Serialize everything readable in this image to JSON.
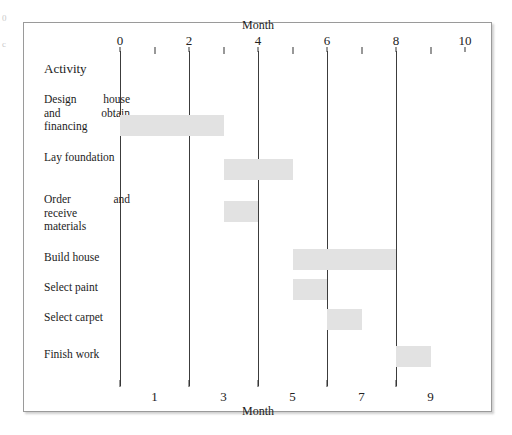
{
  "figure": {
    "axis_title_top": "Month",
    "axis_title_bottom": "Month",
    "activity_header": "Activity",
    "bar_color": "#e2e2e2",
    "gridline_color": "#3c3c3c",
    "frame_border_color": "#9a9a9a"
  },
  "margin_artifacts": [
    "0",
    "c"
  ],
  "chart_data": {
    "type": "bar",
    "subtype": "gantt",
    "title": "",
    "xlabel": "Month",
    "ylabel": "Activity",
    "xlim": [
      0,
      10
    ],
    "grid": true,
    "legend": "none",
    "top_axis": {
      "major_ticks": [
        0,
        2,
        4,
        6,
        8,
        10
      ],
      "major_tick_labels": [
        "0",
        "2",
        "4",
        "6",
        "8",
        "10"
      ],
      "minor_ticks": [
        1,
        3,
        5,
        7,
        9
      ],
      "gridline_values": [
        0,
        2,
        4,
        6,
        8
      ]
    },
    "bottom_axis": {
      "ticks": [
        0,
        2,
        4,
        6,
        8
      ],
      "labels_at": [
        1,
        3,
        5,
        7,
        9
      ],
      "labels": [
        "1",
        "3",
        "5",
        "7",
        "9"
      ]
    },
    "categories": [
      "Design house and obtain financing",
      "Lay foundation",
      "Order and receive materials",
      "Build house",
      "Select paint",
      "Select carpet",
      "Finish work"
    ],
    "tasks": [
      {
        "label": "Design house and obtain financing",
        "label_lines": [
          "Design house",
          "and obtain",
          "financing"
        ],
        "start": 0,
        "end": 3,
        "duration": 3
      },
      {
        "label": "Lay foundation",
        "label_lines": [
          "Lay foundation"
        ],
        "start": 3,
        "end": 5,
        "duration": 2
      },
      {
        "label": "Order and receive materials",
        "label_lines": [
          "Order and",
          "receive",
          "materials"
        ],
        "start": 3,
        "end": 4,
        "duration": 1
      },
      {
        "label": "Build house",
        "label_lines": [
          "Build house"
        ],
        "start": 5,
        "end": 8,
        "duration": 3
      },
      {
        "label": "Select paint",
        "label_lines": [
          "Select paint"
        ],
        "start": 5,
        "end": 6,
        "duration": 1
      },
      {
        "label": "Select carpet",
        "label_lines": [
          "Select carpet"
        ],
        "start": 6,
        "end": 7,
        "duration": 1
      },
      {
        "label": "Finish work",
        "label_lines": [
          "Finish work"
        ],
        "start": 8,
        "end": 9,
        "duration": 1
      }
    ]
  }
}
